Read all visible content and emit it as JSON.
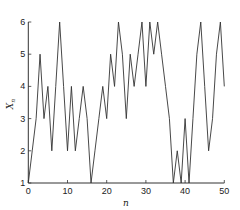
{
  "chart_data": {
    "type": "line",
    "title": "",
    "xlabel": "n",
    "ylabel": "X_n",
    "ylabel_main": "X",
    "ylabel_sub": "n",
    "xlim": [
      0,
      50
    ],
    "ylim": [
      1,
      6
    ],
    "grid": false,
    "legend": null,
    "x_ticks": [
      0,
      10,
      20,
      30,
      40,
      50
    ],
    "y_ticks": [
      1,
      2,
      3,
      4,
      5,
      6
    ],
    "x": [
      0,
      1,
      2,
      3,
      4,
      5,
      6,
      7,
      8,
      9,
      10,
      11,
      12,
      13,
      14,
      15,
      16,
      17,
      18,
      19,
      20,
      21,
      22,
      23,
      24,
      25,
      26,
      27,
      28,
      29,
      30,
      31,
      32,
      33,
      34,
      35,
      36,
      37,
      38,
      39,
      40,
      41,
      42,
      43,
      44,
      45,
      46,
      47,
      48,
      49,
      50
    ],
    "series": [
      {
        "name": "X_n",
        "color": "#333333",
        "values": [
          1,
          2,
          3,
          5,
          3,
          4,
          2,
          4,
          6,
          4,
          2,
          4,
          2,
          3,
          4,
          3,
          1,
          2,
          3,
          4,
          3,
          5,
          4,
          6,
          5,
          3,
          5,
          4,
          5,
          6,
          4,
          6,
          5,
          6,
          5,
          4,
          3,
          1,
          2,
          1,
          3,
          1,
          3,
          5,
          6,
          4,
          2,
          3,
          5,
          6,
          4
        ]
      }
    ]
  },
  "style": {
    "line_color": "#333333",
    "axis_color": "#333333",
    "background": "#ffffff"
  }
}
